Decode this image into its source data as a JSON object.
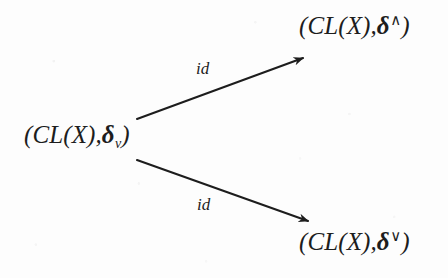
{
  "figure": {
    "type": "commutative-diagram",
    "background_color": "#fdfdfd",
    "ink_color": "#1d1d1d"
  },
  "nodes": {
    "left": {
      "name": "source-object",
      "full_text": "(CL(X),δᵥ)",
      "open_paren": "(",
      "operator": "CL(X)",
      "comma": ",",
      "delta": "δ",
      "subscript": "v",
      "close_paren": ")"
    },
    "top_right": {
      "name": "upper-target-object",
      "full_text": "(CL(X),δ^)",
      "open_paren": "(",
      "operator": "CL(X)",
      "comma": ",",
      "delta": "δ",
      "superscript": "∧",
      "close_paren": ")"
    },
    "bottom_right": {
      "name": "lower-target-object",
      "full_text": "(CL(X),δ∨)",
      "open_paren": "(",
      "operator": "CL(X)",
      "comma": ",",
      "delta": "δ",
      "superscript": "∨",
      "close_paren": ")"
    }
  },
  "edges": [
    {
      "name": "upper-arrow",
      "label": "id",
      "from": "left",
      "to": "top_right",
      "start": [
        137,
        119
      ],
      "end": [
        306,
        57
      ]
    },
    {
      "name": "lower-arrow",
      "label": "id",
      "from": "left",
      "to": "bottom_right",
      "start": [
        137,
        160
      ],
      "end": [
        311,
        222
      ]
    }
  ]
}
